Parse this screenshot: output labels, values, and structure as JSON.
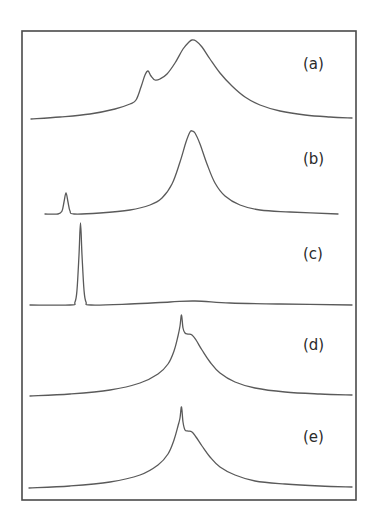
{
  "chart_data": {
    "type": "line",
    "title": "",
    "xlabel": "",
    "ylabel": "",
    "grid": false,
    "legend": "none",
    "note": "Five vertically stacked spectra panels (a)-(e) inside one frame; no axes ticks shown. Coordinates are in image pixel space (x: horizontal position, y: trace height above each panel's baseline, in px).",
    "frame": {
      "x0": 22,
      "y0": 31,
      "x1": 356,
      "y1": 500
    },
    "series": [
      {
        "name": "(a)",
        "label": "(a)",
        "label_pos": [
          303,
          69
        ],
        "baseline_y": 119,
        "points": [
          [
            31,
            0
          ],
          [
            60,
            2
          ],
          [
            90,
            5
          ],
          [
            115,
            10
          ],
          [
            130,
            15
          ],
          [
            136,
            19
          ],
          [
            141,
            32
          ],
          [
            145,
            44
          ],
          [
            148,
            48
          ],
          [
            151,
            43
          ],
          [
            155,
            39
          ],
          [
            160,
            40
          ],
          [
            167,
            45
          ],
          [
            175,
            56
          ],
          [
            183,
            70
          ],
          [
            189,
            77
          ],
          [
            192,
            79
          ],
          [
            196,
            78
          ],
          [
            202,
            72
          ],
          [
            210,
            60
          ],
          [
            220,
            46
          ],
          [
            232,
            33
          ],
          [
            245,
            22
          ],
          [
            260,
            14
          ],
          [
            280,
            8
          ],
          [
            305,
            4
          ],
          [
            330,
            2
          ],
          [
            352,
            1
          ]
        ]
      },
      {
        "name": "(b)",
        "label": "(b)",
        "label_pos": [
          303,
          164
        ],
        "baseline_y": 214,
        "points": [
          [
            45,
            0
          ],
          [
            58,
            0
          ],
          [
            62,
            3
          ],
          [
            64,
            12
          ],
          [
            66,
            21
          ],
          [
            68,
            12
          ],
          [
            70,
            3
          ],
          [
            74,
            0
          ],
          [
            100,
            1
          ],
          [
            130,
            4
          ],
          [
            150,
            9
          ],
          [
            162,
            16
          ],
          [
            172,
            30
          ],
          [
            180,
            52
          ],
          [
            186,
            72
          ],
          [
            190,
            82
          ],
          [
            192,
            83
          ],
          [
            195,
            81
          ],
          [
            200,
            70
          ],
          [
            207,
            50
          ],
          [
            215,
            31
          ],
          [
            225,
            18
          ],
          [
            240,
            9
          ],
          [
            260,
            4
          ],
          [
            290,
            2
          ],
          [
            338,
            0
          ]
        ]
      },
      {
        "name": "(c)",
        "label": "(c)",
        "label_pos": [
          303,
          259
        ],
        "baseline_y": 305,
        "points": [
          [
            30,
            0
          ],
          [
            70,
            0
          ],
          [
            75,
            3
          ],
          [
            77,
            15
          ],
          [
            79,
            50
          ],
          [
            80.5,
            82
          ],
          [
            82,
            50
          ],
          [
            84,
            15
          ],
          [
            86,
            3
          ],
          [
            91,
            0
          ],
          [
            130,
            1
          ],
          [
            170,
            3
          ],
          [
            195,
            4
          ],
          [
            230,
            2
          ],
          [
            280,
            1
          ],
          [
            352,
            0
          ]
        ]
      },
      {
        "name": "(d)",
        "label": "(d)",
        "label_pos": [
          303,
          350
        ],
        "baseline_y": 396,
        "points": [
          [
            30,
            0
          ],
          [
            70,
            2
          ],
          [
            110,
            6
          ],
          [
            140,
            13
          ],
          [
            158,
            22
          ],
          [
            168,
            32
          ],
          [
            174,
            45
          ],
          [
            178,
            60
          ],
          [
            180,
            70
          ],
          [
            181.5,
            81
          ],
          [
            183,
            68
          ],
          [
            185,
            63
          ],
          [
            188,
            62
          ],
          [
            192,
            61
          ],
          [
            196,
            56
          ],
          [
            202,
            46
          ],
          [
            210,
            34
          ],
          [
            220,
            23
          ],
          [
            235,
            14
          ],
          [
            255,
            8
          ],
          [
            285,
            4
          ],
          [
            320,
            2
          ],
          [
            352,
            1
          ]
        ]
      },
      {
        "name": "(e)",
        "label": "(e)",
        "label_pos": [
          303,
          442
        ],
        "baseline_y": 488,
        "points": [
          [
            29,
            0
          ],
          [
            70,
            2
          ],
          [
            110,
            6
          ],
          [
            140,
            13
          ],
          [
            158,
            23
          ],
          [
            168,
            34
          ],
          [
            174,
            48
          ],
          [
            178,
            62
          ],
          [
            180,
            70
          ],
          [
            181.5,
            81
          ],
          [
            183,
            66
          ],
          [
            185,
            58
          ],
          [
            188,
            57
          ],
          [
            192,
            56
          ],
          [
            196,
            51
          ],
          [
            202,
            42
          ],
          [
            210,
            31
          ],
          [
            220,
            21
          ],
          [
            235,
            13
          ],
          [
            255,
            7
          ],
          [
            285,
            4
          ],
          [
            320,
            2
          ],
          [
            352,
            1
          ]
        ]
      }
    ]
  },
  "colors": {
    "frame": "#4a4a4a",
    "trace": "#5a5a5a",
    "label": "#2b2b2b",
    "background": "#ffffff"
  }
}
